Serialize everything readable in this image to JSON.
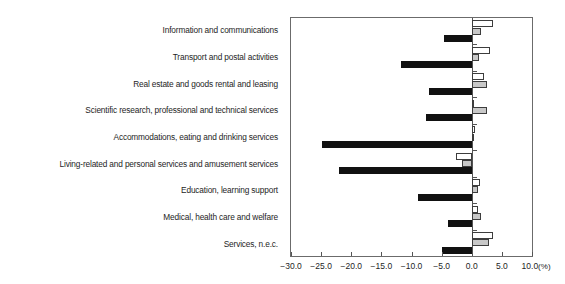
{
  "chart_data": {
    "type": "bar",
    "orientation": "horizontal",
    "title": "",
    "subtitle": "",
    "xlabel": "(%)",
    "ylabel": "",
    "xlim": [
      -30.0,
      10.0
    ],
    "xticks": [
      "-30.0",
      "-25.0",
      "-20.0",
      "-15.0",
      "-10.0",
      "-5.0",
      "0.0",
      "5.0",
      "10.0"
    ],
    "xtick_values": [
      -30.0,
      -25.0,
      -20.0,
      -15.0,
      -10.0,
      -5.0,
      0.0,
      5.0,
      10.0
    ],
    "unit_suffix": "(%)",
    "grid": false,
    "legend_position": "top-left-inside",
    "categories": [
      "Information and communications",
      "Transport and postal activities",
      "Real estate and goods rental and leasing",
      "Scientific research, professional and technical services",
      "Accommodations, eating and drinking services",
      "Living-related and personal services and amusement services",
      "Education, learning support",
      "Medical, health care and welfare",
      "Services, n.e.c."
    ],
    "series": [
      {
        "name": "2018",
        "color": "#ffffff",
        "values": [
          3.6,
          3.1,
          2.1,
          0.4,
          0.6,
          -2.6,
          1.4,
          1.1,
          3.6
        ]
      },
      {
        "name": "2019",
        "color": "#c8c8c8",
        "values": [
          1.6,
          1.2,
          2.6,
          2.6,
          0.3,
          -1.6,
          1.1,
          1.6,
          2.9
        ]
      },
      {
        "name": "2020",
        "color": "#111111",
        "values": [
          -4.6,
          -11.8,
          -7.1,
          -7.6,
          -24.8,
          -22.1,
          -8.9,
          -3.9,
          -4.9
        ]
      }
    ]
  },
  "legend": {
    "items": [
      {
        "label": "2018",
        "swatch": "white-outline"
      },
      {
        "label": "2019",
        "swatch": "gray-outline"
      },
      {
        "label": "2020",
        "swatch": "black-filled"
      }
    ]
  }
}
